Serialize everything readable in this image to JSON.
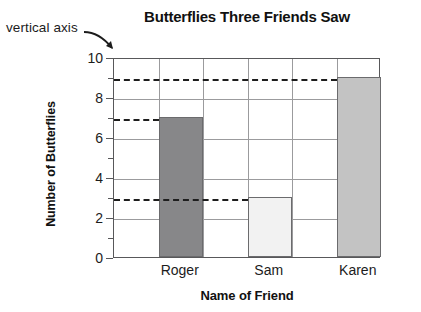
{
  "annotation": {
    "label": "vertical axis",
    "arrow_icon": "curved-arrow-down-right-icon"
  },
  "chart_data": {
    "type": "bar",
    "title": "Butterflies Three Friends Saw",
    "xlabel": "Name of Friend",
    "ylabel": "Number of Butterflies",
    "categories": [
      "Roger",
      "Sam",
      "Karen"
    ],
    "values": [
      7,
      3,
      9
    ],
    "bar_colors": [
      "#878789",
      "#f2f2f2",
      "#c3c3c3"
    ],
    "bar_border_color": "#6b6b6d",
    "ylim": [
      0,
      10
    ],
    "ytick_labels": [
      "0",
      "2",
      "4",
      "6",
      "8",
      "10"
    ],
    "ytick_values": [
      0,
      2,
      4,
      6,
      8,
      10
    ],
    "yminor_values": [
      1,
      3,
      5,
      7,
      9
    ],
    "grid": "horizontal-and-vertical",
    "gridline_color": "#9b9b9d",
    "axis_color": "#58585a",
    "legend": "none",
    "annotations": [
      {
        "type": "dashed-guide",
        "value": 9,
        "from": "y-axis",
        "to": "Karen"
      },
      {
        "type": "dashed-guide",
        "value": 7,
        "from": "y-axis",
        "to": "Roger"
      },
      {
        "type": "dashed-guide",
        "value": 3,
        "from": "y-axis",
        "to": "Sam"
      }
    ]
  }
}
